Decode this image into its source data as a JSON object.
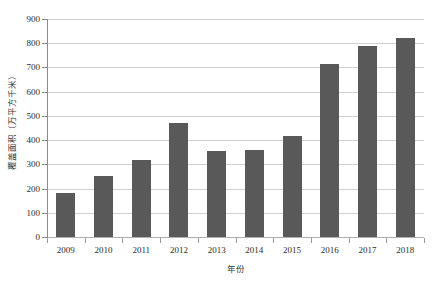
{
  "chart_data": {
    "type": "bar",
    "title": "",
    "subtitle": "",
    "xlabel": "年份",
    "ylabel": "覆盖面积（万平方千米）",
    "categories": [
      "2009",
      "2010",
      "2011",
      "2012",
      "2013",
      "2014",
      "2015",
      "2016",
      "2017",
      "2018"
    ],
    "values": [
      180,
      250,
      320,
      470,
      355,
      360,
      415,
      715,
      790,
      820
    ],
    "series": [
      {
        "name": "覆盖面积",
        "values": [
          180,
          250,
          320,
          470,
          355,
          360,
          415,
          715,
          790,
          820
        ]
      }
    ],
    "ylim": [
      0,
      900
    ],
    "ytick_step": 100,
    "ytick_labels": [
      "0",
      "100",
      "200",
      "300",
      "400",
      "500",
      "600",
      "700",
      "800",
      "900"
    ],
    "ytick_values": [
      0,
      100,
      200,
      300,
      400,
      500,
      600,
      700,
      800,
      900
    ],
    "grid": true,
    "grid_axis": "y",
    "legend": false,
    "legend_position": "none",
    "bar_color": "#595959",
    "gridline_color": "#CFCFCF",
    "axis_color": "#8C8C8C",
    "background_color": "#FFFFFF",
    "text_color": "#2B2B2B"
  }
}
